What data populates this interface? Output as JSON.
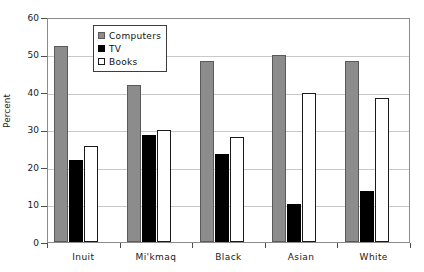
{
  "chart_data": {
    "type": "bar",
    "title": "",
    "xlabel": "",
    "ylabel": "Percent",
    "ylim": [
      0,
      60
    ],
    "yticks": [
      0,
      10,
      20,
      30,
      40,
      50,
      60
    ],
    "ytick_labels": [
      "0",
      "10",
      "20",
      "30",
      "40",
      "50",
      "60"
    ],
    "grid": true,
    "legend_position": "upper-left-inside",
    "categories": [
      "Inuit",
      "Mi'kmaq",
      "Black",
      "Asian",
      "White"
    ],
    "series": [
      {
        "name": "Computers",
        "color": "#8c8c8c",
        "values": [
          52.3,
          41.8,
          48.2,
          50.0,
          48.4
        ]
      },
      {
        "name": "TV",
        "color": "#000000",
        "values": [
          22.0,
          28.5,
          23.4,
          10.2,
          13.5
        ]
      },
      {
        "name": "Books",
        "color": "#ffffff",
        "values": [
          25.5,
          29.8,
          28.0,
          39.8,
          38.5
        ]
      }
    ]
  },
  "legend": {
    "items": [
      {
        "label": "Computers",
        "swatch": "computers"
      },
      {
        "label": "TV",
        "swatch": "tv"
      },
      {
        "label": "Books",
        "swatch": "books"
      }
    ]
  },
  "axes": {
    "y_title": "Percent"
  },
  "title_sliver": {
    "text": ""
  }
}
